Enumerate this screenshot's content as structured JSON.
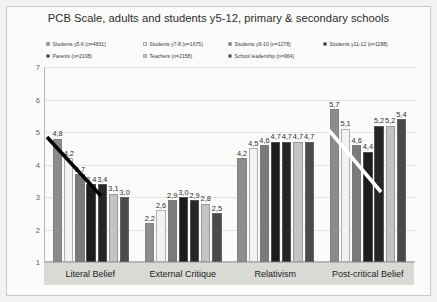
{
  "chart_data": {
    "type": "bar",
    "title": "PCB Scale, adults and students y5-12, primary & secondary schools",
    "xlabel": "",
    "ylabel": "",
    "ylim": [
      1,
      7
    ],
    "yticks": [
      "7",
      "6",
      "5",
      "4",
      "3",
      "2",
      "1"
    ],
    "grid": true,
    "legend_position": "top",
    "categories": [
      "Literal Belief",
      "External Critique",
      "Relativism",
      "Post-critical Belief"
    ],
    "series": [
      {
        "name": "Students y5-6 (n=4831)",
        "color": "#8c8c8c",
        "values": [
          4.8,
          2.2,
          4.2,
          5.7
        ],
        "labels": [
          "4,8",
          "2,2",
          "4,2",
          "5,7"
        ]
      },
      {
        "name": "Students y7-8 (n=1675)",
        "color": "#f2f2f0",
        "values": [
          4.2,
          2.6,
          4.5,
          5.1
        ],
        "labels": [
          "4,2",
          "2,6",
          "4,5",
          "5,1"
        ]
      },
      {
        "name": "Students y9-10 (n=1278)",
        "color": "#7a7a7a",
        "values": [
          3.7,
          2.9,
          4.6,
          4.6
        ],
        "labels": [
          "3,7",
          "2,9",
          "4,6",
          "4,6"
        ]
      },
      {
        "name": "Students y11-12 (n=1188)",
        "color": "#1c1c1c",
        "values": [
          3.4,
          3.0,
          4.7,
          4.4
        ],
        "labels": [
          "3,4",
          "3,0",
          "4,7",
          "4,4"
        ]
      },
      {
        "name": "Parents (n=2108)",
        "color": "#262626",
        "values": [
          3.4,
          2.9,
          4.7,
          5.2
        ],
        "labels": [
          "3,4",
          "2,9",
          "4,7",
          "5,2"
        ]
      },
      {
        "name": "Teachers (n=2158)",
        "color": "#c4c4c2",
        "values": [
          3.1,
          2.8,
          4.7,
          5.2
        ],
        "labels": [
          "3,1",
          "2,8",
          "4,7",
          "5,2"
        ]
      },
      {
        "name": "School leadership (n=964)",
        "color": "#4a4a4a",
        "values": [
          3.0,
          2.5,
          4.7,
          5.4
        ],
        "labels": [
          "3,0",
          "2,5",
          "4,7",
          "5,4"
        ]
      }
    ],
    "annotations": [
      {
        "name": "declining-trend-line-literal-belief",
        "color": "#000000"
      },
      {
        "name": "declining-trend-line-post-critical-belief",
        "color": "#ffffff"
      }
    ]
  }
}
